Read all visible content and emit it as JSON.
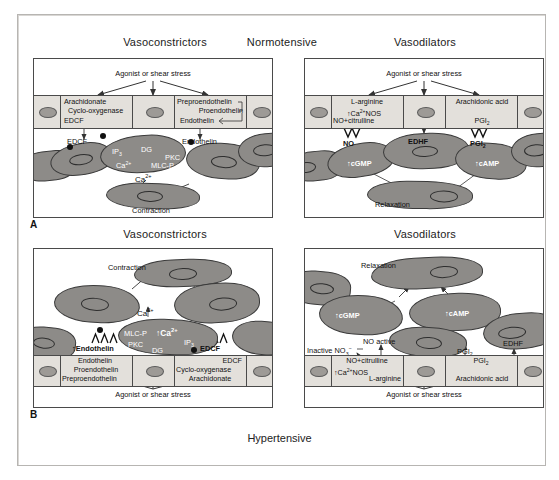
{
  "figure": {
    "center_top_title": "Normotensive",
    "center_bottom_title": "Hypertensive",
    "panel_a_label": "A",
    "panel_b_label": "B"
  },
  "titles": {
    "a_left": "Vasoconstrictors",
    "a_right": "Vasodilators",
    "b_left": "Vasoconstrictors",
    "b_right": "Vasodilators"
  },
  "stimulus": {
    "label": "Agonist or shear stress"
  },
  "panel_a_left": {
    "endothelium": {
      "box1_line1": "Arachidonate",
      "box1_line2": "Cyclo-oxygenase",
      "box1_line3": "EDCF",
      "box2_line1": "Preproendothelin",
      "box2_line2": "Proendothelin",
      "box2_line3": "Endothelin"
    },
    "mediators": {
      "edcf": "EDCF",
      "endothelin": "Endothelin"
    },
    "smc": {
      "ip3": "IP",
      "ip3_sub": "3",
      "dg": "DG",
      "pkc": "PKC",
      "ca_in": "Ca",
      "ca_in_sup": "2+",
      "mlcp": "MLC-P",
      "ca_free": "Ca",
      "ca_free_sup": "2+",
      "outcome": "Contraction"
    }
  },
  "panel_a_right": {
    "endothelium": {
      "box1_line1": "L-arginine",
      "box1_line2": "Ca",
      "box1_line2_sup": "2+",
      "box1_line2b": "NOS",
      "box1_line3": "NO+citrulline",
      "box3_line1": "Arachidonic acid",
      "box3_line2": "PGI",
      "box3_line2_sub": "2"
    },
    "mediators": {
      "no": "NO",
      "edhf": "EDHF",
      "pgi2": "PGI",
      "pgi2_sub": "2"
    },
    "smc": {
      "cgmp": "cGMP",
      "camp": "cAMP",
      "outcome": "Relaxation"
    }
  },
  "panel_b_left": {
    "smc": {
      "outcome": "Contraction",
      "ca_free": "Ca",
      "ca_free_sup": "2+",
      "mlcp": "MLC-P",
      "ca_in": "Ca",
      "ca_in_sup": "2+",
      "pkc": "PKC",
      "dg": "DG",
      "ip3": "IP",
      "ip3_sub": "3"
    },
    "mediators": {
      "endothelin": "Endothelin",
      "endothelin_prefix": "↑",
      "edcf": "EDCF"
    },
    "endothelium": {
      "box1_line1": "Endothelin",
      "box1_line2": "Proendothelin",
      "box1_line3": "Preproendothelin",
      "box3_line1": "EDCF",
      "box3_line2": "Cyclo-oxygenase",
      "box3_line3": "Arachidonate"
    }
  },
  "panel_b_right": {
    "smc": {
      "outcome": "Relaxation",
      "cgmp": "cGMP",
      "camp": "cAMP"
    },
    "mediators": {
      "inactive": "Inactive NO",
      "inactive_sub": "3",
      "inactive_sup": "−",
      "superoxide": "O",
      "superoxide_sub": "2",
      "superoxide_sup": "−",
      "no_active": "NO active",
      "pgi2": "PGI",
      "pgi2_sub": "2",
      "edhf": "EDHF"
    },
    "endothelium": {
      "box1_line1": "NO+citrulline",
      "box1_line2": "Ca",
      "box1_line2_sup": "2+",
      "box1_line2b": "NOS",
      "box1_line3": "L-arginine",
      "box3_line1": "PGI",
      "box3_line1_sub": "2",
      "box3_line2": "Arachidonic acid"
    }
  },
  "colors": {
    "cell_fill": "#8d8b88",
    "endothelium_fill": "#e3e0db",
    "stroke": "#3a3a3a",
    "frame": "#b7b5b2"
  }
}
